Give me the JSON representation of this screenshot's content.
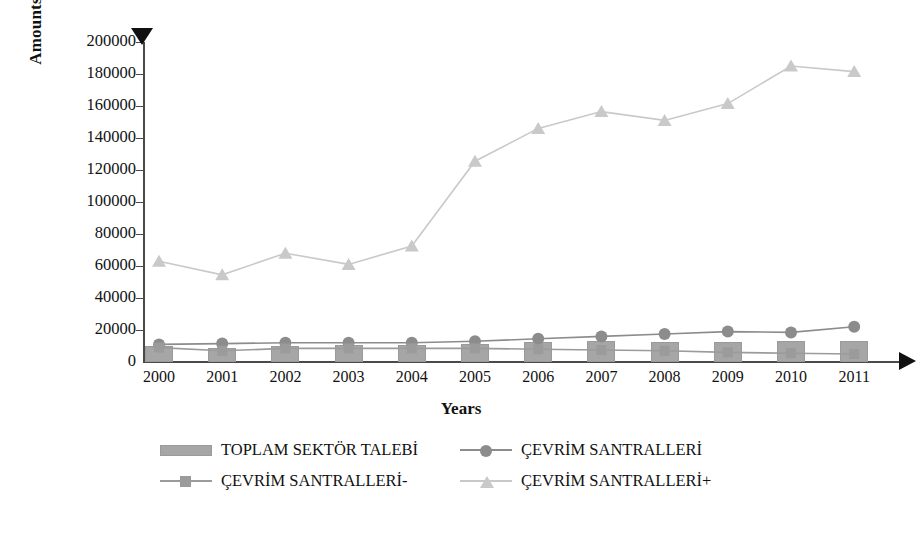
{
  "chart_data": {
    "type": "line",
    "title": "",
    "xlabel": "Years",
    "ylabel": "Amounts (kTOE)",
    "categories": [
      "2000",
      "2001",
      "2002",
      "2003",
      "2004",
      "2005",
      "2006",
      "2007",
      "2008",
      "2009",
      "2010",
      "2011"
    ],
    "ylim": [
      0,
      200000
    ],
    "ytick_step": 20000,
    "yticks": [
      "0",
      "20000",
      "40000",
      "60000",
      "80000",
      "100000",
      "120000",
      "140000",
      "160000",
      "180000",
      "200000"
    ],
    "grid": false,
    "legend_position": "bottom",
    "series": [
      {
        "name": "TOPLAM SEKTÖR TALEBİ",
        "type": "bar",
        "color": "#a6a6a6",
        "marker": "bar",
        "values": [
          10000,
          8500,
          10000,
          10500,
          10500,
          11000,
          12500,
          13000,
          12500,
          12500,
          13000,
          13000
        ]
      },
      {
        "name": "ÇEVRİM SANTRALLERİ",
        "type": "line",
        "color": "#8c8c8c",
        "marker": "circle",
        "values": [
          11000,
          11500,
          12000,
          12000,
          12000,
          13000,
          14500,
          16000,
          17500,
          19000,
          18500,
          22000
        ]
      },
      {
        "name": "ÇEVRİM SANTRALLERİ-",
        "type": "line",
        "color": "#9b9b9b",
        "marker": "square",
        "values": [
          9000,
          7000,
          8500,
          8500,
          8500,
          8500,
          8000,
          7500,
          7000,
          6000,
          5500,
          5000
        ]
      },
      {
        "name": "ÇEVRİM SANTRALLERİ+",
        "type": "line",
        "color": "#c9c9c9",
        "marker": "triangle",
        "values": [
          63000,
          54500,
          68000,
          61000,
          72500,
          125500,
          146000,
          156500,
          151000,
          161500,
          185000,
          181500
        ]
      }
    ]
  },
  "axis": {
    "y_arrow_icon": "triangle-down-icon",
    "x_arrow_icon": "arrow-right-icon"
  }
}
